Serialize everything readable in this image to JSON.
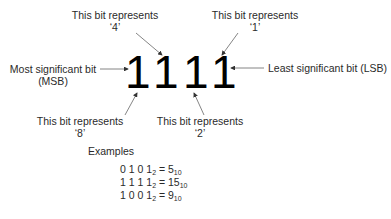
{
  "diagram": {
    "bits": [
      "1",
      "1",
      "1",
      "1"
    ],
    "msb_label": {
      "line1": "Most significant bit",
      "line2": "(MSB)"
    },
    "lsb_label": "Least significant bit (LSB)",
    "bit_labels": [
      {
        "position": "top",
        "target_bit": 2,
        "line1": "This bit represents",
        "line2": "‘4’"
      },
      {
        "position": "top",
        "target_bit": 4,
        "line1": "This bit represents",
        "line2": "‘1’"
      },
      {
        "position": "bottom",
        "target_bit": 1,
        "line1": "This bit represents",
        "line2": "‘8’"
      },
      {
        "position": "bottom",
        "target_bit": 3,
        "line1": "This bit represents",
        "line2": "‘2’"
      }
    ],
    "examples": {
      "title": "Examples",
      "rows": [
        {
          "binary": "0 1 0 1",
          "base_in": "2",
          "equals": "=",
          "decimal": "5",
          "base_out": "10"
        },
        {
          "binary": "1 1 1 1",
          "base_in": "2",
          "equals": "=",
          "decimal": "15",
          "base_out": "10"
        },
        {
          "binary": "1 0 0 1",
          "base_in": "2",
          "equals": "=",
          "decimal": "9",
          "base_out": "10"
        }
      ]
    },
    "colors": {
      "text": "#2a2a2a",
      "digits": "#000000",
      "arrows": "#555555"
    }
  }
}
